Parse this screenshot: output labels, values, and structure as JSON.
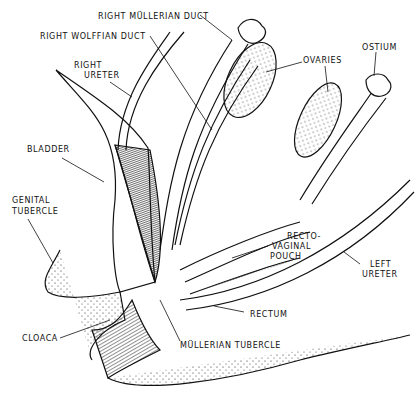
{
  "diagram": {
    "labels": {
      "right_mullerian_duct": "RIGHT MÜLLERIAN DUCT",
      "right_wolffian_duct": "RIGHT WOLFFIAN DUCT",
      "right_ureter_1": "RIGHT",
      "right_ureter_2": "URETER",
      "ovaries": "OVARIES",
      "ostium": "OSTIUM",
      "bladder": "BLADDER",
      "genital_tubercle_1": "GENITAL",
      "genital_tubercle_2": "TUBERCLE",
      "recto_vaginal_pouch_1": "RECTO-",
      "recto_vaginal_pouch_2": "VAGINAL",
      "recto_vaginal_pouch_3": "POUCH",
      "left_ureter_1": "LEFT",
      "left_ureter_2": "URETER",
      "rectum": "RECTUM",
      "cloaca": "CLOACA",
      "mullerian_tubercle": "MÜLLERIAN TUBERCLE"
    },
    "colors": {
      "ink": "#111111",
      "background": "#ffffff",
      "shade": "#333333"
    }
  }
}
